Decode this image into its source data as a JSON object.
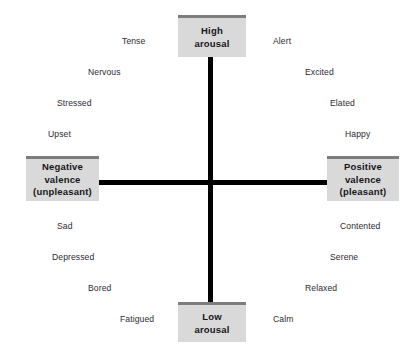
{
  "diagram": {
    "colors": {
      "box_fill": "#d9d9d9",
      "box_top_border": "#7d7d7d",
      "axis": "#000000",
      "label_text": "#2b2b30",
      "box_text": "#15151a",
      "background": "#ffffff"
    },
    "axes": {
      "vertical": {
        "name": "arousal-axis",
        "high_label": "High\narousal",
        "low_label": "Low\narousal"
      },
      "horizontal": {
        "name": "valence-axis",
        "negative_label": "Negative\nvalence\n(unpleasant)",
        "positive_label": "Positive\nvalence\n(pleasant)"
      }
    },
    "anchors": [
      {
        "id": "high-arousal",
        "text": "High\narousal",
        "position": "top"
      },
      {
        "id": "low-arousal",
        "text": "Low\narousal",
        "position": "bottom"
      },
      {
        "id": "negative-valence",
        "text": "Negative\nvalence\n(unpleasant)",
        "position": "left"
      },
      {
        "id": "positive-valence",
        "text": "Positive\nvalence\n(pleasant)",
        "position": "right"
      }
    ],
    "quadrants": {
      "upper_left": {
        "name": "high-arousal-negative-valence",
        "labels": [
          "Tense",
          "Nervous",
          "Stressed",
          "Upset"
        ]
      },
      "upper_right": {
        "name": "high-arousal-positive-valence",
        "labels": [
          "Alert",
          "Excited",
          "Elated",
          "Happy"
        ]
      },
      "lower_left": {
        "name": "low-arousal-negative-valence",
        "labels": [
          "Sad",
          "Depressed",
          "Bored",
          "Fatigued"
        ]
      },
      "lower_right": {
        "name": "low-arousal-positive-valence",
        "labels": [
          "Contented",
          "Serene",
          "Relaxed",
          "Calm"
        ]
      }
    },
    "emotions": [
      {
        "id": "tense",
        "label": "Tense",
        "x": 122,
        "y": 36,
        "align": "left"
      },
      {
        "id": "nervous",
        "label": "Nervous",
        "x": 88,
        "y": 67,
        "align": "left"
      },
      {
        "id": "stressed",
        "label": "Stressed",
        "x": 57,
        "y": 98,
        "align": "left"
      },
      {
        "id": "upset",
        "label": "Upset",
        "x": 48,
        "y": 129,
        "align": "left"
      },
      {
        "id": "alert",
        "label": "Alert",
        "x": 273,
        "y": 36,
        "align": "left"
      },
      {
        "id": "excited",
        "label": "Excited",
        "x": 305,
        "y": 67,
        "align": "left"
      },
      {
        "id": "elated",
        "label": "Elated",
        "x": 330,
        "y": 98,
        "align": "left"
      },
      {
        "id": "happy",
        "label": "Happy",
        "x": 345,
        "y": 129,
        "align": "left"
      },
      {
        "id": "sad",
        "label": "Sad",
        "x": 57,
        "y": 221,
        "align": "left"
      },
      {
        "id": "depressed",
        "label": "Depressed",
        "x": 52,
        "y": 252,
        "align": "left"
      },
      {
        "id": "bored",
        "label": "Bored",
        "x": 88,
        "y": 283,
        "align": "left"
      },
      {
        "id": "fatigued",
        "label": "Fatigued",
        "x": 120,
        "y": 314,
        "align": "left"
      },
      {
        "id": "contented",
        "label": "Contented",
        "x": 340,
        "y": 221,
        "align": "left"
      },
      {
        "id": "serene",
        "label": "Serene",
        "x": 330,
        "y": 252,
        "align": "left"
      },
      {
        "id": "relaxed",
        "label": "Relaxed",
        "x": 305,
        "y": 283,
        "align": "left"
      },
      {
        "id": "calm",
        "label": "Calm",
        "x": 273,
        "y": 314,
        "align": "left"
      }
    ]
  }
}
